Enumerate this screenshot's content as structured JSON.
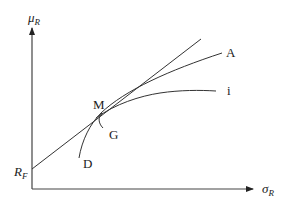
{
  "diagram": {
    "type": "efficient-frontier-tangency",
    "axes": {
      "y_label": {
        "main": "μ",
        "sub": "R"
      },
      "x_label": {
        "main": "σ",
        "sub": "R"
      }
    },
    "intercept_label": {
      "main": "R",
      "sub": "F"
    },
    "point_labels": {
      "tangency": "M",
      "line_a": "A",
      "indifference": "i",
      "lower_curve": "G",
      "frontier": "D"
    },
    "colors": {
      "lines": "#333333",
      "text": "#222222",
      "background": "#ffffff"
    }
  }
}
